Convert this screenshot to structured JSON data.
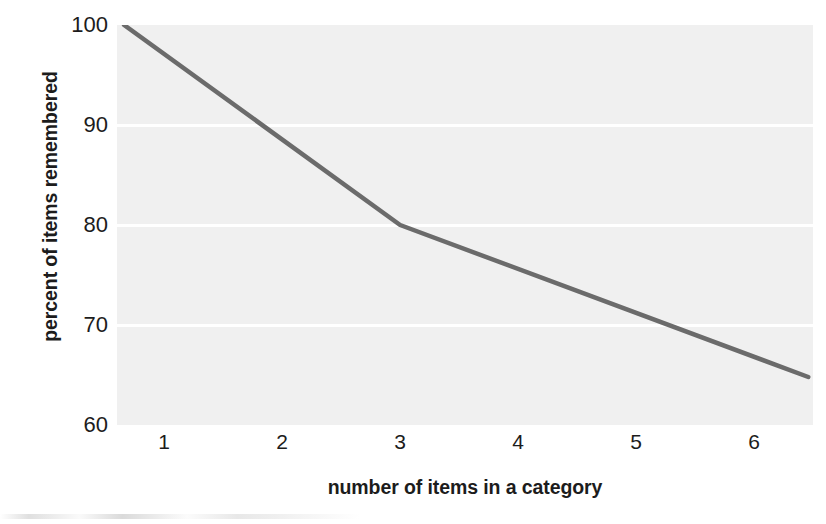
{
  "chart_data": {
    "type": "line",
    "title": "",
    "xlabel": "number of items in a category",
    "ylabel": "percent of items remembered",
    "xlim": [
      0.6,
      6.5
    ],
    "ylim": [
      60,
      100
    ],
    "xticks": [
      1,
      2,
      3,
      4,
      5,
      6
    ],
    "xtick_labels": [
      "1",
      "2",
      "3",
      "4",
      "5",
      "6"
    ],
    "yticks": [
      60,
      70,
      80,
      90,
      100
    ],
    "ytick_labels": [
      "60",
      "70",
      "80",
      "90",
      "100"
    ],
    "grid": "horizontal-white-gridlines",
    "legend": "none",
    "series": [
      {
        "name": "percent of items remembered",
        "x": [
          0.66,
          3.0,
          6.46
        ],
        "y": [
          100.0,
          80.0,
          64.8
        ],
        "color": "#6b6b6b",
        "linewidth": 4.5
      }
    ],
    "points": [
      {
        "x": 0.66,
        "y": 100.0
      },
      {
        "x": 1.0,
        "y": 97.1
      },
      {
        "x": 2.0,
        "y": 88.6
      },
      {
        "x": 3.0,
        "y": 80.0
      },
      {
        "x": 4.0,
        "y": 75.6
      },
      {
        "x": 5.0,
        "y": 71.2
      },
      {
        "x": 6.0,
        "y": 66.8
      },
      {
        "x": 6.46,
        "y": 64.8
      }
    ]
  },
  "style": {
    "plot_background": "#f0f0f0",
    "gridline_color": "#ffffff",
    "line_color": "#6b6b6b",
    "text_color": "#1c1c1c",
    "figure_background": "#ffffff"
  }
}
